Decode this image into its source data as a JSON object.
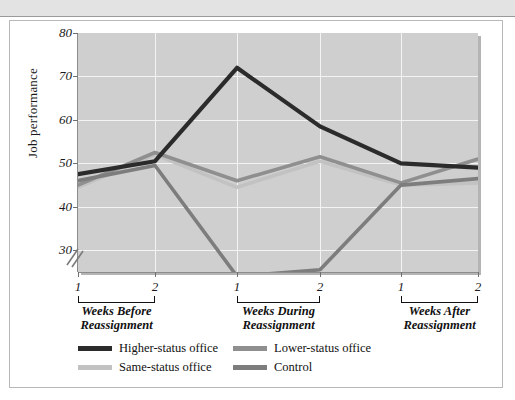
{
  "figure": {
    "y_axis_label": "Job performance",
    "has_axis_break": true,
    "axis_break_icon": "axis-break-slashes-icon"
  },
  "chart_data": {
    "type": "line",
    "title": "",
    "xlabel": "",
    "ylabel": "Job performance",
    "ylim": [
      25,
      80
    ],
    "yticks": [
      30,
      40,
      50,
      60,
      70,
      80
    ],
    "grid": true,
    "legend_position": "bottom-left",
    "x": [
      "1",
      "2",
      "1",
      "2",
      "1",
      "2"
    ],
    "x_tick_labels": [
      "1",
      "2",
      "1",
      "2",
      "1",
      "2"
    ],
    "x_groups": [
      {
        "label": "Weeks Before\nReassignment",
        "line1": "Weeks Before",
        "line2": "Reassignment",
        "points": [
          "1",
          "2"
        ]
      },
      {
        "label": "Weeks During\nReassignment",
        "line1": "Weeks During",
        "line2": "Reassignment",
        "points": [
          "1",
          "2"
        ]
      },
      {
        "label": "Weeks After\nReassignment",
        "line1": "Weeks After",
        "line2": "Reassignment",
        "points": [
          "1",
          "2"
        ]
      }
    ],
    "series": [
      {
        "name": "Higher-status office",
        "color": "#2b2b2b",
        "values": [
          47.5,
          50.5,
          72.0,
          58.5,
          50.0,
          49.0
        ]
      },
      {
        "name": "Lower-status office",
        "color": "#8f8f8f",
        "values": [
          45.0,
          52.5,
          46.0,
          51.5,
          45.5,
          51.0
        ]
      },
      {
        "name": "Same-status office",
        "color": "#c2c2c2",
        "values": [
          44.5,
          52.0,
          44.5,
          50.5,
          45.0,
          45.5
        ]
      },
      {
        "name": "Control",
        "color": "#7d7d7d",
        "values": [
          46.0,
          49.5,
          24.0,
          25.5,
          45.0,
          46.5
        ]
      }
    ]
  },
  "legend": {
    "entries": [
      {
        "label": "Higher-status office",
        "color": "#2b2b2b"
      },
      {
        "label": "Lower-status office",
        "color": "#8f8f8f"
      },
      {
        "label": "Same-status office",
        "color": "#c2c2c2"
      },
      {
        "label": "Control",
        "color": "#7d7d7d"
      }
    ]
  }
}
